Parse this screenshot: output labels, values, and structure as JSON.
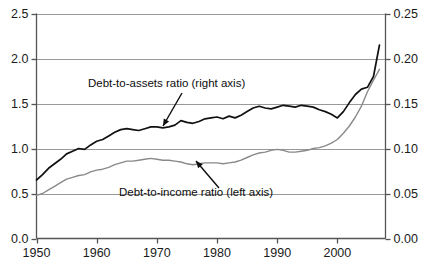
{
  "chart_data": {
    "type": "line",
    "title": "",
    "subtitle": "",
    "xlabel": "",
    "ylabel": "",
    "y2label": "",
    "grid": true,
    "legend_position": "inline-annotations",
    "xlim": [
      1950,
      2008
    ],
    "ylim": [
      0.0,
      2.5
    ],
    "y2lim": [
      0.0,
      0.25
    ],
    "xticks": [
      1950,
      1960,
      1970,
      1980,
      1990,
      2000
    ],
    "xticklabels": [
      "1950",
      "1960",
      "1970",
      "1980",
      "1990",
      "2000"
    ],
    "yticks": [
      0.0,
      0.5,
      1.0,
      1.5,
      2.0,
      2.5
    ],
    "yticklabels": [
      "0.0",
      "0.5",
      "1.0",
      "1.5",
      "2.0",
      "2.5"
    ],
    "y2ticks": [
      0.0,
      0.05,
      0.1,
      0.15,
      0.2,
      0.25
    ],
    "y2ticklabels": [
      "0.00",
      "0.05",
      "0.10",
      "0.15",
      "0.20",
      "0.25"
    ],
    "annotations": [
      {
        "id": "debt-to-assets",
        "text": "Debt-to-assets ratio (right axis)",
        "text_x": 88,
        "text_y": 87,
        "arrow_from_x": 182,
        "arrow_from_y": 93,
        "arrow_to_x": 163,
        "arrow_to_y": 126
      },
      {
        "id": "debt-to-income",
        "text": "Debt-to-income ratio (left axis)",
        "text_x": 119,
        "text_y": 196,
        "arrow_from_x": 219,
        "arrow_from_y": 188,
        "arrow_to_x": 196,
        "arrow_to_y": 161
      }
    ],
    "series": [
      {
        "name": "Debt-to-assets ratio (right axis)",
        "axis": "right",
        "color": "#111111",
        "width": 1.7,
        "x": [
          1950,
          1951,
          1952,
          1953,
          1954,
          1955,
          1956,
          1957,
          1958,
          1959,
          1960,
          1961,
          1962,
          1963,
          1964,
          1965,
          1966,
          1967,
          1968,
          1969,
          1970,
          1971,
          1972,
          1973,
          1974,
          1975,
          1976,
          1977,
          1978,
          1979,
          1980,
          1981,
          1982,
          1983,
          1984,
          1985,
          1986,
          1987,
          1988,
          1989,
          1990,
          1991,
          1992,
          1993,
          1994,
          1995,
          1996,
          1997,
          1998,
          1999,
          2000,
          2001,
          2002,
          2003,
          2004,
          2005,
          2006,
          2007
        ],
        "values": [
          0.065,
          0.071,
          0.078,
          0.083,
          0.088,
          0.094,
          0.097,
          0.1,
          0.099,
          0.104,
          0.108,
          0.11,
          0.114,
          0.118,
          0.121,
          0.122,
          0.121,
          0.12,
          0.122,
          0.124,
          0.124,
          0.123,
          0.124,
          0.126,
          0.131,
          0.129,
          0.128,
          0.13,
          0.133,
          0.134,
          0.135,
          0.133,
          0.136,
          0.134,
          0.137,
          0.141,
          0.145,
          0.147,
          0.145,
          0.144,
          0.146,
          0.148,
          0.147,
          0.146,
          0.148,
          0.147,
          0.146,
          0.143,
          0.141,
          0.138,
          0.134,
          0.141,
          0.151,
          0.16,
          0.166,
          0.168,
          0.18,
          0.215
        ]
      },
      {
        "name": "Debt-to-income ratio (left axis)",
        "axis": "left",
        "color": "#8a8a8a",
        "width": 1.4,
        "x": [
          1950,
          1951,
          1952,
          1953,
          1954,
          1955,
          1956,
          1957,
          1958,
          1959,
          1960,
          1961,
          1962,
          1963,
          1964,
          1965,
          1966,
          1967,
          1968,
          1969,
          1970,
          1971,
          1972,
          1973,
          1974,
          1975,
          1976,
          1977,
          1978,
          1979,
          1980,
          1981,
          1982,
          1983,
          1984,
          1985,
          1986,
          1987,
          1988,
          1989,
          1990,
          1991,
          1992,
          1993,
          1994,
          1995,
          1996,
          1997,
          1998,
          1999,
          2000,
          2001,
          2002,
          2003,
          2004,
          2005,
          2006,
          2007
        ],
        "values": [
          0.48,
          0.5,
          0.54,
          0.58,
          0.62,
          0.66,
          0.68,
          0.7,
          0.71,
          0.74,
          0.76,
          0.77,
          0.79,
          0.82,
          0.84,
          0.86,
          0.86,
          0.87,
          0.88,
          0.89,
          0.88,
          0.87,
          0.87,
          0.86,
          0.85,
          0.83,
          0.82,
          0.83,
          0.84,
          0.84,
          0.84,
          0.83,
          0.84,
          0.85,
          0.87,
          0.9,
          0.93,
          0.95,
          0.96,
          0.98,
          0.99,
          0.98,
          0.96,
          0.96,
          0.97,
          0.98,
          1.0,
          1.01,
          1.03,
          1.06,
          1.1,
          1.17,
          1.25,
          1.35,
          1.47,
          1.63,
          1.76,
          1.88
        ]
      }
    ]
  },
  "axes": {
    "left_tick_labels": [
      "2.5",
      "2.0",
      "1.5",
      "1.0",
      "0.5",
      "0.0"
    ],
    "right_tick_labels": [
      "0.25",
      "0.20",
      "0.15",
      "0.10",
      "0.05",
      "0.00"
    ],
    "x_tick_labels": [
      "1950",
      "1960",
      "1970",
      "1980",
      "1990",
      "2000"
    ]
  },
  "colors": {
    "background": "#ffffff",
    "axis": "#555555",
    "grid": "#999999",
    "series_dark": "#111111",
    "series_gray": "#8a8a8a",
    "text": "#111111"
  }
}
